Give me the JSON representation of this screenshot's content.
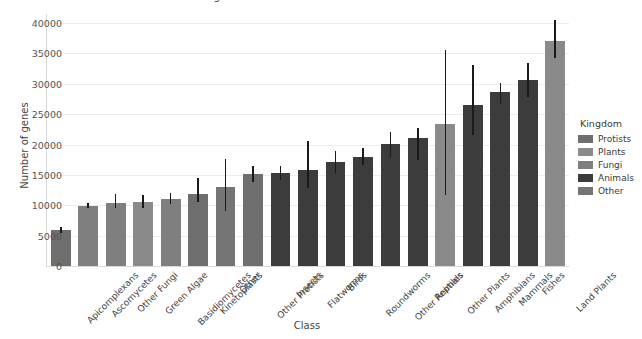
{
  "chart_data": {
    "type": "bar",
    "title": "for genomes in different classes",
    "xlabel": "Class",
    "ylabel": "Number of genes",
    "ylim": [
      0,
      41500
    ],
    "yticks": [
      0,
      5000,
      10000,
      15000,
      20000,
      25000,
      30000,
      35000,
      40000
    ],
    "grid": true,
    "legend_position": "right",
    "categories": [
      "Apicomplexans",
      "Ascomycetes",
      "Other Fungi",
      "Green Algae",
      "Basidiomycetes",
      "Kinetoplasts",
      "Other",
      "Other Protists",
      "Insects",
      "Flatworms",
      "Birds",
      "Roundworms",
      "Other Animals",
      "Reptiles",
      "Other Plants",
      "Amphibians",
      "Mammals",
      "Fishes",
      "Land Plants"
    ],
    "values": [
      6000,
      9900,
      10400,
      10500,
      11000,
      11900,
      13000,
      15100,
      15300,
      15800,
      17100,
      17900,
      20100,
      21000,
      23400,
      26500,
      28700,
      30600,
      37100
    ],
    "error_low": [
      5500,
      9500,
      9500,
      9600,
      10200,
      10600,
      9100,
      13900,
      14200,
      12900,
      15400,
      16700,
      17800,
      17400,
      11700,
      21600,
      26700,
      27900,
      34200
    ],
    "error_high": [
      6500,
      10400,
      11800,
      11700,
      12100,
      14500,
      17700,
      16500,
      16500,
      20600,
      19000,
      19500,
      22000,
      22700,
      35500,
      33100,
      30100,
      33500,
      40500
    ],
    "kingdoms": [
      "Protists",
      "Fungi",
      "Fungi",
      "Plants",
      "Fungi",
      "Protists",
      "Other",
      "Protists",
      "Animals",
      "Animals",
      "Animals",
      "Animals",
      "Animals",
      "Animals",
      "Plants",
      "Animals",
      "Animals",
      "Animals",
      "Plants"
    ]
  },
  "legend": {
    "title": "Kingdom",
    "entries": [
      {
        "label": "Protists",
        "color": "#6e6e6e"
      },
      {
        "label": "Plants",
        "color": "#8a8a8a"
      },
      {
        "label": "Fungi",
        "color": "#7f7f7f"
      },
      {
        "label": "Animals",
        "color": "#3c3c3c"
      },
      {
        "label": "Other",
        "color": "#757575"
      }
    ]
  },
  "colors": {
    "Protists": "#6e6e6e",
    "Plants": "#8a8a8a",
    "Fungi": "#7f7f7f",
    "Animals": "#3c3c3c",
    "Other": "#757575",
    "grid": "#ececec",
    "axis": "#d9d9d9",
    "error": "#1a1a1a"
  }
}
